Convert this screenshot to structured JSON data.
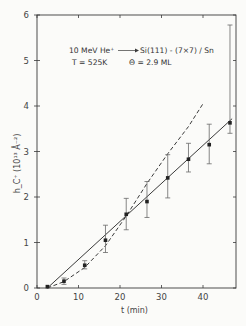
{
  "chart_data": {
    "type": "scatter",
    "title": "",
    "annotations": {
      "line1_left": "10 MeV He⁺",
      "line1_right": "Si(111) - (7×7) / Sn",
      "line2_left": "T = 525K",
      "line2_right": "Θ = 2.9 ML"
    },
    "xlabel": "t (min)",
    "ylabel": "h_C⁺ (10¹³ Å⁻²)",
    "xlim": [
      0,
      47
    ],
    "ylim": [
      0,
      6.2
    ],
    "xticks": [
      0,
      10,
      20,
      30,
      40
    ],
    "yticks": [
      0,
      1,
      2,
      3,
      4,
      5,
      6
    ],
    "grid": false,
    "legend": null,
    "series": [
      {
        "name": "measured",
        "style": "points-with-errorbars",
        "x": [
          2.5,
          6.5,
          11.5,
          16.5,
          21.5,
          26.5,
          31.5,
          36.5,
          41.5,
          46.5
        ],
        "y": [
          0.03,
          0.15,
          0.5,
          1.05,
          1.62,
          1.9,
          2.42,
          2.83,
          3.15,
          3.63
        ],
        "err_low": [
          0.03,
          0.08,
          0.42,
          0.78,
          1.28,
          1.55,
          1.98,
          2.55,
          2.73,
          3.4
        ],
        "err_high": [
          0.03,
          0.22,
          0.6,
          1.38,
          1.97,
          2.34,
          2.93,
          3.18,
          3.6,
          5.78
        ]
      },
      {
        "name": "linear fit",
        "style": "solid",
        "x": [
          2.5,
          47
        ],
        "y": [
          0.0,
          3.72
        ]
      },
      {
        "name": "quadratic fit",
        "style": "dashed",
        "x": [
          2.5,
          6.5,
          11.5,
          16.5,
          21.5,
          26.5,
          31.5,
          36.5,
          40
        ],
        "y": [
          0.0,
          0.14,
          0.45,
          0.93,
          1.58,
          2.3,
          2.95,
          3.55,
          4.05
        ]
      }
    ]
  }
}
